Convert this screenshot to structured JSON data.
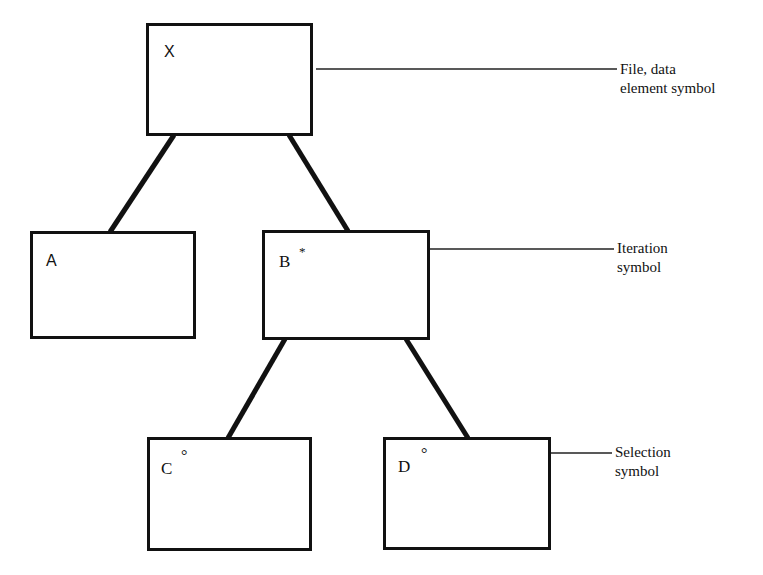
{
  "diagram": {
    "type": "Jackson structure diagram",
    "nodes": [
      {
        "id": "X",
        "label": "X",
        "marker": ""
      },
      {
        "id": "A",
        "label": "A",
        "marker": ""
      },
      {
        "id": "B",
        "label": "B",
        "marker": "*"
      },
      {
        "id": "C",
        "label": "C",
        "marker": "°"
      },
      {
        "id": "D",
        "label": "D",
        "marker": "°"
      }
    ],
    "edges": [
      {
        "from": "X",
        "to": "A"
      },
      {
        "from": "X",
        "to": "B"
      },
      {
        "from": "B",
        "to": "C"
      },
      {
        "from": "B",
        "to": "D"
      }
    ],
    "annotations": [
      {
        "target": "X",
        "line1": "File, data",
        "line2": "element symbol"
      },
      {
        "target": "B",
        "line1": "Iteration",
        "line2": "symbol"
      },
      {
        "target": "D",
        "line1": "Selection",
        "line2": "symbol"
      }
    ]
  }
}
